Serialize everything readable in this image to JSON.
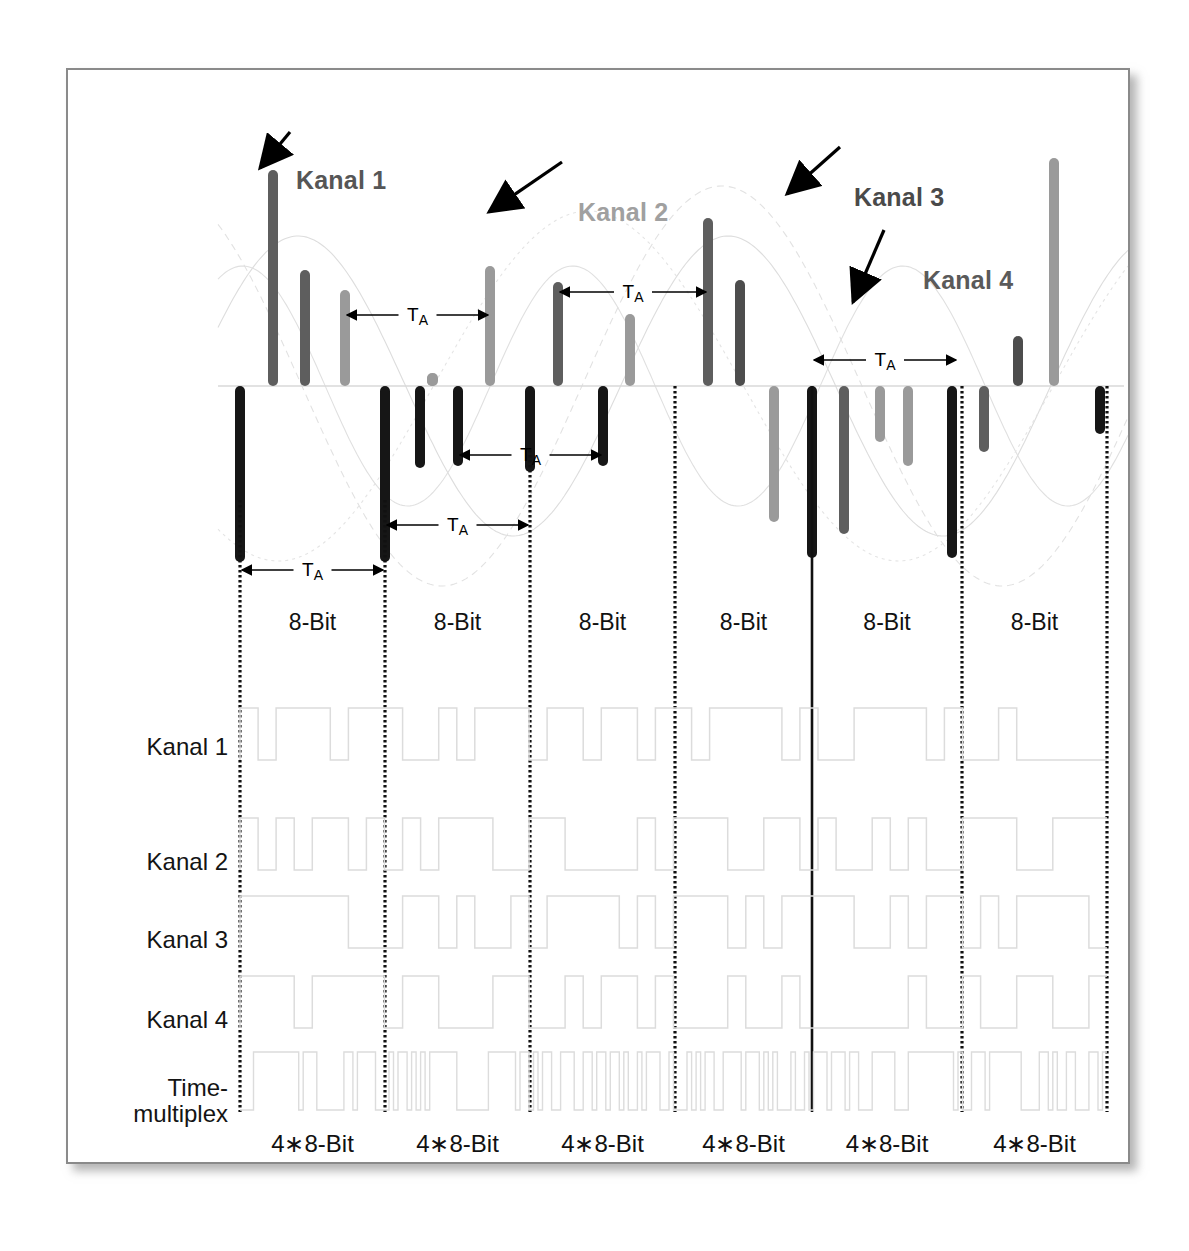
{
  "figure": {
    "title_annotations": [
      {
        "name": "kanal-1",
        "label": "Kanal 1",
        "color": "#565656",
        "x": 228,
        "y": 96,
        "arrow": {
          "x1": 288,
          "y1": 130,
          "x2": 258,
          "y2": 166
        }
      },
      {
        "name": "kanal-2",
        "label": "Kanal 2",
        "color": "#a0a0a0",
        "x": 510,
        "y": 128,
        "arrow": {
          "x1": 560,
          "y1": 160,
          "x2": 487,
          "y2": 210
        }
      },
      {
        "name": "kanal-3",
        "label": "Kanal 3",
        "color": "#4a4a4a",
        "x": 786,
        "y": 113,
        "arrow": {
          "x1": 838,
          "y1": 145,
          "x2": 785,
          "y2": 192
        }
      },
      {
        "name": "kanal-4",
        "label": "Kanal 4",
        "color": "#5a5a5a",
        "x": 855,
        "y": 196,
        "arrow": {
          "x1": 882,
          "y1": 228,
          "x2": 851,
          "y2": 300
        }
      }
    ],
    "row_labels": [
      {
        "name": "row-label-kanal-1",
        "label": "Kanal 1",
        "y": 675
      },
      {
        "name": "row-label-kanal-2",
        "label": "Kanal 2",
        "y": 790
      },
      {
        "name": "row-label-kanal-3",
        "label": "Kanal 3",
        "y": 868
      },
      {
        "name": "row-label-kanal-4",
        "label": "Kanal 4",
        "y": 948
      },
      {
        "name": "row-label-time-multiplex",
        "label": "Time-\nmultiplex",
        "y": 1030
      }
    ],
    "segment_label": "8-Bit",
    "bottom_label": "4∗8-Bit",
    "segment_count": 6,
    "ta_label": "T",
    "ta_subscript": "A",
    "colors": {
      "kanal1_bar": "#5e5e5e",
      "kanal2_bar": "#9a9a9a",
      "kanal3_bar": "#4d4d4d",
      "kanal4_bar": "#161616",
      "frame_border": "#8a8a8a",
      "baseline": "#d8d8d8",
      "waveform": "#dcdcdc",
      "grid_line": "#111111",
      "text": "#111111"
    },
    "grid_x": [
      172,
      317,
      462,
      607,
      744,
      894,
      1039
    ],
    "solid_grid_index": 4,
    "baseline_y": 316,
    "ta_arrows": [
      {
        "name": "ta-arrow-1",
        "x1": 172,
        "x2": 317,
        "y": 500
      },
      {
        "name": "ta-arrow-2",
        "x1": 317,
        "x2": 462,
        "y": 455
      },
      {
        "name": "ta-arrow-3",
        "x1": 390,
        "x2": 535,
        "y": 385
      },
      {
        "name": "ta-arrow-4",
        "x1": 277,
        "x2": 422,
        "y": 245
      },
      {
        "name": "ta-arrow-5",
        "x1": 490,
        "x2": 640,
        "y": 222
      },
      {
        "name": "ta-arrow-6",
        "x1": 744,
        "x2": 890,
        "y": 290
      }
    ]
  },
  "chart_data": {
    "type": "line",
    "xlabel": "",
    "ylabel": "",
    "grid": true,
    "legend": [
      "Kanal 1",
      "Kanal 2",
      "Kanal 3",
      "Kanal 4"
    ],
    "baseline": 0,
    "sample_bars": [
      {
        "channel": "Kanal 4",
        "x": 172,
        "value": -176
      },
      {
        "channel": "Kanal 1",
        "x": 205,
        "value": 216
      },
      {
        "channel": "Kanal 1",
        "x": 237,
        "value": 116
      },
      {
        "channel": "Kanal 2",
        "x": 277,
        "value": 96
      },
      {
        "channel": "Kanal 4",
        "x": 317,
        "value": -176
      },
      {
        "channel": "Kanal 4",
        "x": 352,
        "value": -82
      },
      {
        "channel": "Kanal 2",
        "x": 364,
        "value": 12
      },
      {
        "channel": "Kanal 2",
        "x": 422,
        "value": 120
      },
      {
        "channel": "Kanal 4",
        "x": 390,
        "value": -80
      },
      {
        "channel": "Kanal 4",
        "x": 462,
        "value": -86
      },
      {
        "channel": "Kanal 1",
        "x": 490,
        "value": 104
      },
      {
        "channel": "Kanal 4",
        "x": 535,
        "value": -80
      },
      {
        "channel": "Kanal 2",
        "x": 562,
        "value": 72
      },
      {
        "channel": "Kanal 1",
        "x": 607,
        "value": 0
      },
      {
        "channel": "Kanal 1",
        "x": 640,
        "value": 168
      },
      {
        "channel": "Kanal 3",
        "x": 672,
        "value": 106
      },
      {
        "channel": "Kanal 2",
        "x": 706,
        "value": -136
      },
      {
        "channel": "Kanal 4",
        "x": 744,
        "value": -172
      },
      {
        "channel": "Kanal 1",
        "x": 776,
        "value": -148
      },
      {
        "channel": "Kanal 2",
        "x": 812,
        "value": -56
      },
      {
        "channel": "Kanal 2",
        "x": 840,
        "value": -80
      },
      {
        "channel": "Kanal 4",
        "x": 884,
        "value": -172
      },
      {
        "channel": "Kanal 1",
        "x": 916,
        "value": -66
      },
      {
        "channel": "Kanal 3",
        "x": 950,
        "value": 50
      },
      {
        "channel": "Kanal 2",
        "x": 986,
        "value": 228
      },
      {
        "channel": "Kanal 4",
        "x": 1032,
        "value": -48
      }
    ],
    "digital_rows": [
      {
        "name": "Kanal 1",
        "bits": "10110100 11011011 01101100 10110101 11010010 10110110"
      },
      {
        "name": "Kanal 2",
        "bits": "01101001 10110010 11001101 01101011 10010110 11011001"
      },
      {
        "name": "Kanal 3",
        "bits": "11010110 01011011 10110100 11011010 01101101 10110011"
      },
      {
        "name": "Kanal 4",
        "bits": "10011010 11011101 01101011 10110110 11010110 01101101"
      },
      {
        "name": "Time-multiplex",
        "bits": "multiplexed 4x8 bit frames"
      }
    ]
  }
}
